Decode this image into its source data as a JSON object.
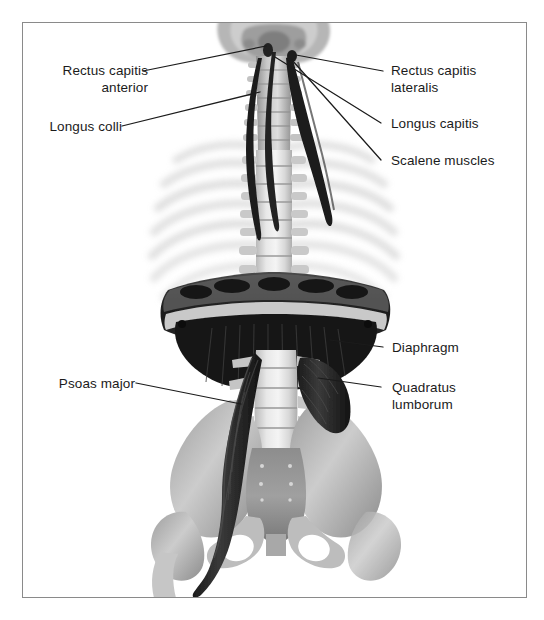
{
  "figure": {
    "background_color": "#ffffff",
    "frame_color": "#8a8a8a",
    "leader_line_color": "#1b1b1b",
    "text_color": "#1b1b1b"
  },
  "labels": {
    "rectus_capitis_anterior": "Rectus capitis\nanterior",
    "longus_colli": "Longus colli",
    "rectus_capitis_lateralis": "Rectus capitis\nlateralis",
    "longus_capitis": "Longus capitis",
    "scalene_muscles": "Scalene muscles",
    "diaphragm": "Diaphragm",
    "psoas_major": "Psoas major",
    "quadratus_lumborum": "Quadratus\nlumborum"
  },
  "annotations": [
    {
      "id": "rectus-capitis-anterior",
      "text": "Rectus capitis anterior",
      "side": "left"
    },
    {
      "id": "longus-colli",
      "text": "Longus colli",
      "side": "left"
    },
    {
      "id": "rectus-capitis-lateralis",
      "text": "Rectus capitis lateralis",
      "side": "right"
    },
    {
      "id": "longus-capitis",
      "text": "Longus capitis",
      "side": "right"
    },
    {
      "id": "scalene-muscles",
      "text": "Scalene muscles",
      "side": "right"
    },
    {
      "id": "diaphragm",
      "text": "Diaphragm",
      "side": "right"
    },
    {
      "id": "psoas-major",
      "text": "Psoas major",
      "side": "left"
    },
    {
      "id": "quadratus-lumborum",
      "text": "Quadratus lumborum",
      "side": "right"
    }
  ],
  "structures": [
    "skull-base",
    "cervical-vertebrae",
    "thoracic-vertebrae",
    "ribs",
    "diaphragm",
    "lumbar-vertebrae",
    "sacrum",
    "ilium",
    "pubic-symphysis",
    "femur-head",
    "psoas-major-muscle",
    "quadratus-lumborum-muscle",
    "longus-colli-muscle",
    "longus-capitis-muscle",
    "scalene-muscle-group"
  ]
}
